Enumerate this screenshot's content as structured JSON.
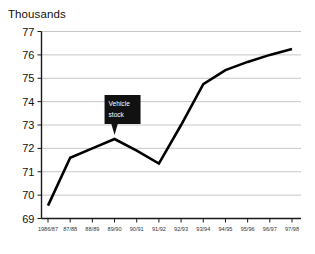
{
  "chart_data": {
    "type": "line",
    "title": "Thousands",
    "xlabel": "",
    "ylabel": "",
    "ylim": [
      69,
      77
    ],
    "ytick_step": 1,
    "grid": true,
    "legend": "none",
    "categories": [
      "1986/87",
      "87/88",
      "88/89",
      "89/90",
      "90/91",
      "91/92",
      "92/93",
      "93/94",
      "94/95",
      "95/96",
      "96/97",
      "97/98"
    ],
    "yticks": [
      "69",
      "70",
      "71",
      "72",
      "73",
      "74",
      "75",
      "76",
      "77"
    ],
    "series": [
      {
        "name": "Vehicle stock",
        "values": [
          69.55,
          71.6,
          72.0,
          72.4,
          71.9,
          71.35,
          73.0,
          74.75,
          75.35,
          75.7,
          76.0,
          76.25
        ]
      }
    ],
    "annotations": [
      {
        "label_line1": "Vehicle",
        "label_line2": "stock",
        "points_to_category": "89/90"
      }
    ],
    "line_color": "#000000",
    "grid_color": "#b9b9b9",
    "axis_color": "#1a1a1a"
  }
}
